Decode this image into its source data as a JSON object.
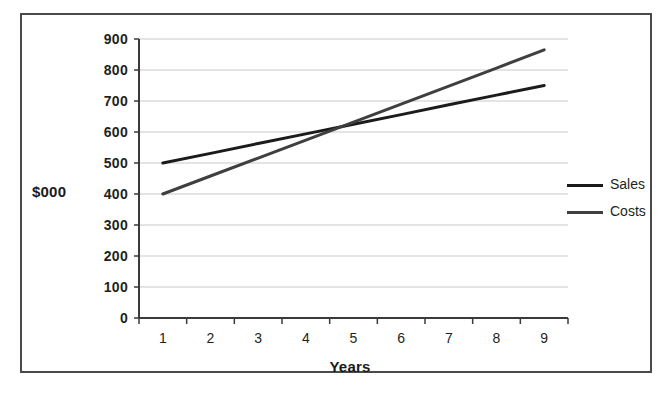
{
  "chart_data": {
    "type": "line",
    "title": "",
    "xlabel": "Years",
    "ylabel": "$000",
    "x": [
      1,
      2,
      3,
      4,
      5,
      6,
      7,
      8,
      9
    ],
    "xtick_labels": [
      "1",
      "2",
      "3",
      "4",
      "5",
      "6",
      "7",
      "8",
      "9"
    ],
    "ytick_labels": [
      "900",
      "800",
      "700",
      "600",
      "500",
      "400",
      "300",
      "200",
      "100",
      "0"
    ],
    "yticks": [
      900,
      800,
      700,
      600,
      500,
      400,
      300,
      200,
      100,
      0
    ],
    "ylim": [
      0,
      900
    ],
    "grid": "horizontal",
    "legend_position": "right",
    "series": [
      {
        "name": "Sales",
        "color": "#1b1b1b",
        "values": [
          500,
          531,
          563,
          594,
          625,
          656,
          688,
          719,
          750
        ]
      },
      {
        "name": "Costs",
        "color": "#3f3f3f",
        "values": [
          400,
          458,
          516,
          574,
          632,
          690,
          748,
          806,
          865
        ]
      }
    ],
    "annotations": {
      "crossover_year": 5.7,
      "crossover_value": 625
    }
  },
  "legend": {
    "items": [
      {
        "label": "Sales",
        "color": "#1b1b1b"
      },
      {
        "label": "Costs",
        "color": "#3f3f3f"
      }
    ]
  },
  "axes": {
    "y_title": "$000",
    "x_title": "Years"
  },
  "colors": {
    "frame": "#4a4a4a",
    "axis": "#3a3a3a",
    "gridline": "#c9c9c9",
    "text": "#231f20",
    "background": "#ffffff"
  }
}
